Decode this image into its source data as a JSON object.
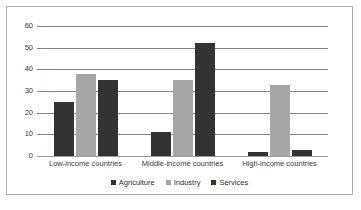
{
  "chart_data": {
    "type": "bar",
    "title": "",
    "subtitle": "",
    "xlabel": "",
    "ylabel": "",
    "categories": [
      "Low-income countries",
      "Middle-income countries",
      "High-income countries"
    ],
    "series": [
      {
        "name": "Agriculture",
        "color": "#333333",
        "values": [
          25,
          11,
          2
        ]
      },
      {
        "name": "Industry",
        "color": "#a6a6a6",
        "values": [
          38,
          35,
          33
        ]
      },
      {
        "name": "Services",
        "color": "#333333",
        "values": [
          35,
          52,
          3
        ]
      }
    ],
    "ylim": [
      0,
      60
    ],
    "yticks": [
      0,
      10,
      20,
      30,
      40,
      50,
      60
    ],
    "ytick_labels": [
      "0",
      "10",
      "20",
      "30",
      "40",
      "50",
      "60"
    ],
    "grid": true,
    "grid_axis": "y",
    "legend": true,
    "legend_position": "bottom",
    "frame_border_color": "#b0b0b0",
    "background": "#ffffff"
  }
}
